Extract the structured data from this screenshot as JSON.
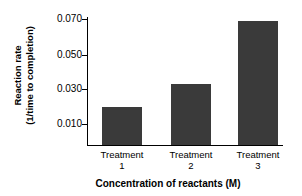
{
  "chart_data": {
    "type": "bar",
    "title": "",
    "subtitle": "",
    "categories": [
      "Treatment 1",
      "Treatment 2",
      "Treatment 3"
    ],
    "category_names": [
      "Treatment",
      "Treatment",
      "Treatment"
    ],
    "category_numbers": [
      "1",
      "2",
      "3"
    ],
    "values": [
      0.02,
      0.033,
      0.069
    ],
    "xlabel": "Concentration of reactants (M)",
    "ylabel_line1": "Reaction rate",
    "ylabel_line2": "(1/time to completion)",
    "ylabel": "Reaction rate (1/time to completion)",
    "ytick_labels": [
      "0.070",
      "0.050",
      "0.030",
      "0.010"
    ],
    "ytick_values": [
      0.07,
      0.05,
      0.03,
      0.01
    ],
    "ylim": [
      0,
      0.074
    ],
    "grid": false,
    "legend": false,
    "bar_color": "#3a3a3a",
    "axis_color": "#000000",
    "background_color": "#ffffff"
  }
}
